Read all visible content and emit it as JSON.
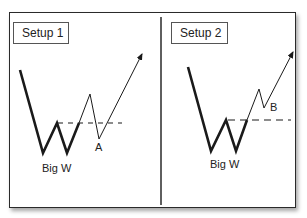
{
  "panels": [
    {
      "title": "Setup 1",
      "pattern_label": "Big W",
      "point_label": "A"
    },
    {
      "title": "Setup 2",
      "pattern_label": "Big W",
      "point_label": "B"
    }
  ],
  "colors": {
    "line": "#1a1a1a",
    "border": "#2a2a2a",
    "background": "#ffffff"
  }
}
